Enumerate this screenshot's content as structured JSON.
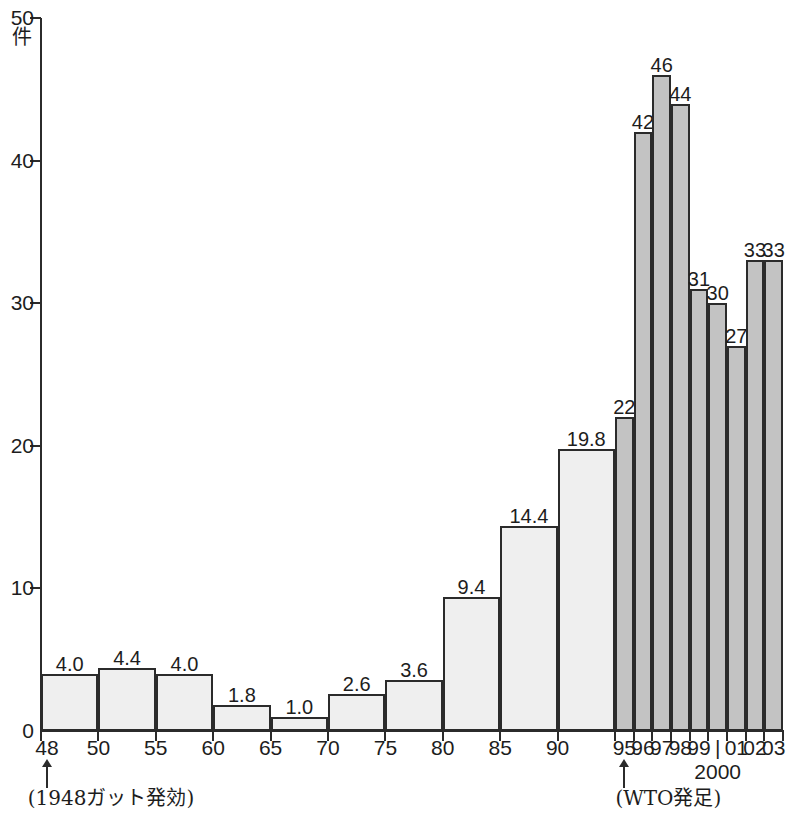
{
  "chart_data": {
    "type": "bar",
    "title": "",
    "subtitle": "",
    "xlabel": "",
    "ylabel": "件",
    "ylim": [
      0,
      50
    ],
    "ytick_labels": [
      "0",
      "10",
      "20",
      "30",
      "40",
      "50"
    ],
    "ytick_values": [
      0,
      10,
      20,
      30,
      40,
      50
    ],
    "grid": false,
    "legend": null,
    "categories": [
      "48",
      "50",
      "55",
      "60",
      "65",
      "70",
      "75",
      "80",
      "85",
      "90",
      "95",
      "96",
      "97",
      "98",
      "99",
      "2000",
      "01",
      "02",
      "03"
    ],
    "series": [
      {
        "name": "GATT period (light bars, 5-year averages)",
        "color": "#efefef",
        "points": [
          {
            "label": "48",
            "tick": "48",
            "value": 4.0,
            "value_label": "4.0",
            "shade": "light"
          },
          {
            "label": "50",
            "tick": "50",
            "value": 4.4,
            "value_label": "4.4",
            "shade": "light"
          },
          {
            "label": "55",
            "tick": "55",
            "value": 4.0,
            "value_label": "4.0",
            "shade": "light"
          },
          {
            "label": "60",
            "tick": "60",
            "value": 1.8,
            "value_label": "1.8",
            "shade": "light"
          },
          {
            "label": "65",
            "tick": "65",
            "value": 1.0,
            "value_label": "1.0",
            "shade": "light"
          },
          {
            "label": "70",
            "tick": "70",
            "value": 2.6,
            "value_label": "2.6",
            "shade": "light"
          },
          {
            "label": "75",
            "tick": "75",
            "value": 3.6,
            "value_label": "3.6",
            "shade": "light"
          },
          {
            "label": "80",
            "tick": "80",
            "value": 9.4,
            "value_label": "9.4",
            "shade": "light"
          },
          {
            "label": "85",
            "tick": "85",
            "value": 14.4,
            "value_label": "14.4",
            "shade": "light"
          },
          {
            "label": "90",
            "tick": "90",
            "value": 19.8,
            "value_label": "19.8",
            "shade": "light"
          }
        ]
      },
      {
        "name": "WTO period (dark bars, yearly)",
        "color": "#c3c3c3",
        "points": [
          {
            "label": "95",
            "tick": "95",
            "value": 22,
            "value_label": "22",
            "shade": "dark"
          },
          {
            "label": "96",
            "tick": "96",
            "value": 42,
            "value_label": "42",
            "shade": "dark"
          },
          {
            "label": "97",
            "tick": "97",
            "value": 46,
            "value_label": "46",
            "shade": "dark"
          },
          {
            "label": "98",
            "tick": "98",
            "value": 44,
            "value_label": "44",
            "shade": "dark"
          },
          {
            "label": "99",
            "tick": "99",
            "value": 31,
            "value_label": "31",
            "shade": "dark"
          },
          {
            "label": "2000",
            "tick": "|",
            "value": 30,
            "value_label": "30",
            "shade": "dark"
          },
          {
            "label": "01",
            "tick": "01",
            "value": 27,
            "value_label": "27",
            "shade": "dark"
          },
          {
            "label": "02",
            "tick": "02",
            "value": 33,
            "value_label": "33",
            "shade": "dark"
          },
          {
            "label": "03",
            "tick": "03",
            "value": 33,
            "value_label": "33",
            "shade": "dark"
          }
        ]
      }
    ],
    "annotations": [
      {
        "text": "(1948ガット発効)",
        "target_tick": "48"
      },
      {
        "text": "(WTO発足)",
        "target_tick": "95"
      }
    ],
    "sublabels": [
      {
        "text": "2000",
        "target_tick": "|"
      }
    ]
  },
  "axis": {
    "y_unit": "件",
    "y_top_label": "50"
  }
}
